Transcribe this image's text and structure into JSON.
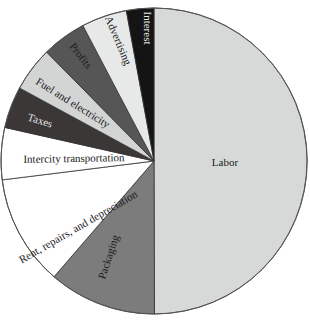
{
  "chart_data": {
    "type": "pie",
    "title": "",
    "start_angle_deg": 0,
    "direction": "counterclockwise-from-top-for-small-slices; labor occupies right half",
    "slices": [
      {
        "label": "Labor",
        "value": 50.0,
        "color": "#d7d9d9",
        "text_color": "#1a1a1a"
      },
      {
        "label": "Packaging",
        "value": 11.4,
        "color": "#7c7c7c",
        "text_color": "#1a1a1a"
      },
      {
        "label": "Rent, repairs, and depreciation",
        "value": 11.7,
        "color": "#ffffff",
        "text_color": "#1a1a1a"
      },
      {
        "label": "Intercity transportation",
        "value": 5.5,
        "color": "#ffffff",
        "text_color": "#1a1a1a"
      },
      {
        "label": "Taxes",
        "value": 4.4,
        "color": "#3b3737",
        "text_color": "#e8e8e8"
      },
      {
        "label": "Fuel and electricity",
        "value": 4.7,
        "color": "#d3d5d5",
        "text_color": "#1a1a1a"
      },
      {
        "label": "Profits",
        "value": 4.7,
        "color": "#565656",
        "text_color": "#1a1a1a"
      },
      {
        "label": "Advertising",
        "value": 4.8,
        "color": "#e7e9e9",
        "text_color": "#1a1a1a"
      },
      {
        "label": "Interest",
        "value": 2.9,
        "color": "#141414",
        "text_color": "#e8e8e8"
      }
    ],
    "legend": "none (labels drawn inside slices)",
    "units": "percent (estimated from slice angles)"
  },
  "labels": {
    "labor": "Labor",
    "packaging": "Packaging",
    "rent": "Rent, repairs, and depreciation",
    "intercity": "Intercity transportation",
    "taxes": "Taxes",
    "fuel": "Fuel and electricity",
    "profits": "Profits",
    "advertising": "Advertising",
    "interest": "Interest"
  }
}
